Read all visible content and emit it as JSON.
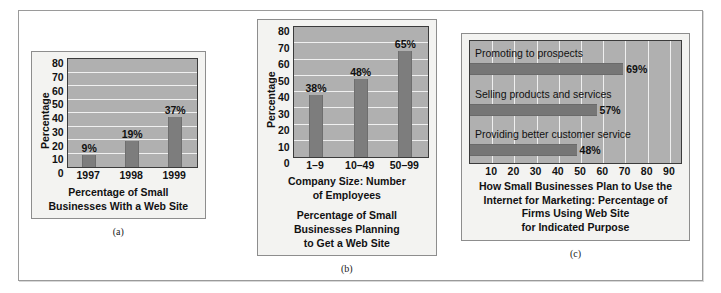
{
  "figure": {
    "panels": [
      {
        "letter": "(a)"
      },
      {
        "letter": "(b)"
      },
      {
        "letter": "(c)"
      }
    ]
  },
  "chart_data": [
    {
      "type": "bar",
      "panel": "(a)",
      "orientation": "vertical",
      "title": "",
      "caption": "Percentage of Small\nBusinesses With a Web Site",
      "xlabel": "",
      "ylabel": "Percentage",
      "categories": [
        "1997",
        "1998",
        "1999"
      ],
      "values": [
        9,
        19,
        37
      ],
      "data_labels": [
        "9%",
        "19%",
        "37%"
      ],
      "ylim": [
        0,
        80
      ],
      "yticks": [
        0,
        10,
        20,
        30,
        40,
        50,
        60,
        70,
        80
      ],
      "ytick_labels": [
        "0",
        "10",
        "20",
        "30",
        "40",
        "50",
        "60",
        "70",
        "80"
      ],
      "grid": true,
      "legend": "none",
      "bar_color": "#7d7d7d",
      "plot_background": "#b0b0b0",
      "gridline_color": "#f0f0f0"
    },
    {
      "type": "bar",
      "panel": "(b)",
      "orientation": "vertical",
      "title": "",
      "xlabel": "Company Size: Number\nof Employees",
      "caption": "Percentage of Small\nBusinesses Planning\nto Get a Web Site",
      "ylabel": "Percentage",
      "categories": [
        "1–9",
        "10–49",
        "50–99"
      ],
      "values": [
        38,
        48,
        65
      ],
      "data_labels": [
        "38%",
        "48%",
        "65%"
      ],
      "ylim": [
        0,
        80
      ],
      "yticks": [
        0,
        10,
        20,
        30,
        40,
        50,
        60,
        70,
        80
      ],
      "ytick_labels": [
        "0",
        "10",
        "20",
        "30",
        "40",
        "50",
        "60",
        "70",
        "80"
      ],
      "grid": true,
      "legend": "none",
      "bar_color": "#7d7d7d",
      "plot_background": "#b0b0b0",
      "gridline_color": "#f0f0f0"
    },
    {
      "type": "bar",
      "panel": "(c)",
      "orientation": "horizontal",
      "title": "",
      "caption": "How Small Businesses Plan to Use the\nInternet for Marketing:  Percentage of\nFirms Using Web Site\nfor Indicated Purpose",
      "xlabel": "",
      "ylabel": "",
      "categories": [
        "Promoting to prospects",
        "Selling products and services",
        "Providing better customer service"
      ],
      "values": [
        69,
        57,
        48
      ],
      "data_labels": [
        "69%",
        "57%",
        "48%"
      ],
      "xlim": [
        0,
        95
      ],
      "xticks": [
        10,
        20,
        30,
        40,
        50,
        60,
        70,
        80,
        90
      ],
      "xtick_labels": [
        "10",
        "20",
        "30",
        "40",
        "50",
        "60",
        "70",
        "80",
        "90"
      ],
      "grid": true,
      "legend": "none",
      "bar_color": "#767676",
      "plot_background": "#b0b0b0",
      "gridline_color": "#efefef"
    }
  ]
}
